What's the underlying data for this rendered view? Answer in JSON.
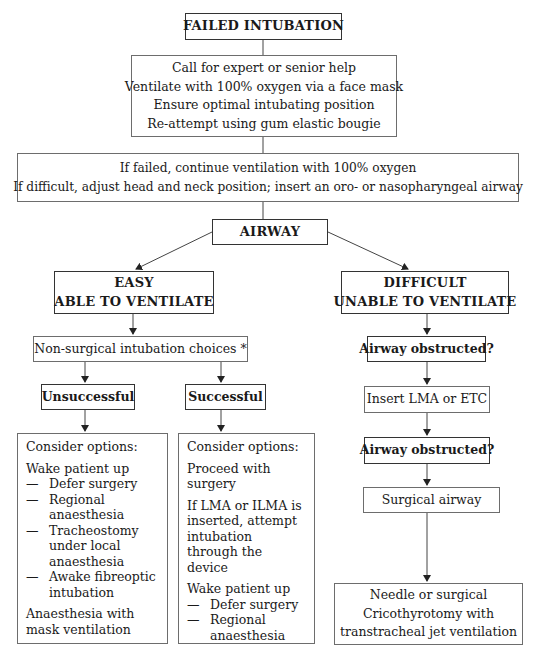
{
  "title": "FAILED INTUBATION",
  "step1": {
    "lines": [
      "Call for expert or senior help",
      "Ventilate with 100% oxygen via a face mask",
      "Ensure optimal intubating position",
      "Re-attempt using gum elastic bougie"
    ]
  },
  "step2": {
    "lines": [
      "If failed, continue ventilation with 100% oxygen",
      "If difficult, adjust head and neck position; insert an oro- or nasopharyngeal airway"
    ]
  },
  "airway": "AIRWAY",
  "easy": {
    "line1": "EASY",
    "line2": "ABLE TO VENTILATE",
    "nonsurgical": "Non-surgical intubation choices *",
    "unsuccessful": {
      "label": "Unsuccessful",
      "header": "Consider options:",
      "wake": "Wake patient up",
      "items": [
        "Defer surgery",
        "Regional anaesthesia",
        "Tracheostomy under local anaesthesia",
        "Awake fibreoptic intubation"
      ],
      "footer": "Anaesthesia with mask ventilation"
    },
    "successful": {
      "label": "Successful",
      "header": "Consider options:",
      "proceed": "Proceed with surgery",
      "lma": "If LMA or ILMA is inserted, attempt intubation through the device",
      "wake": "Wake patient up",
      "items": [
        "Defer surgery",
        "Regional anaesthesia"
      ]
    }
  },
  "difficult": {
    "line1": "DIFFICULT",
    "line2": "UNABLE TO VENTILATE",
    "obstructed1": "Airway obstructed?",
    "insert": "Insert LMA or ETC",
    "obstructed2": "Airway obstructed?",
    "surgical": "Surgical airway",
    "final": {
      "lines": [
        "Needle or surgical",
        "Cricothyrotomy with",
        "transtracheal jet ventilation"
      ]
    }
  },
  "dash_glyph": "—"
}
